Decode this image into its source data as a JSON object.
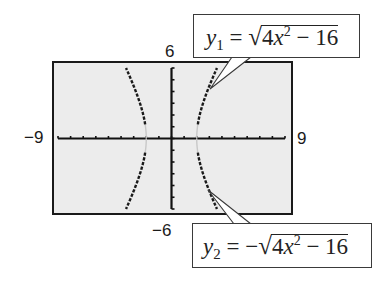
{
  "chart_data": {
    "type": "line",
    "title": "",
    "window": {
      "xmin": -9,
      "xmax": 9,
      "ymin": -6,
      "ymax": 6
    },
    "xlabel": "",
    "ylabel": "",
    "tick_labels": {
      "xmin": "−9",
      "xmax": "9",
      "ymin": "−6",
      "ymax": "6"
    },
    "x_tick_step": 1,
    "y_tick_step": 1,
    "grid": false,
    "series": [
      {
        "name": "y1",
        "equation": "y1 = sqrt(4x^2 - 16)",
        "branch": "upper",
        "domain": "|x| >= 2",
        "points": [
          [
            -3.6,
            6.0
          ],
          [
            -3.4,
            5.36
          ],
          [
            -3.2,
            4.8
          ],
          [
            -3.0,
            4.47
          ],
          [
            -2.8,
            4.0
          ],
          [
            -2.6,
            3.32
          ],
          [
            -2.4,
            2.65
          ],
          [
            -2.2,
            1.83
          ],
          [
            -2.0,
            0
          ],
          [
            2.0,
            0
          ],
          [
            2.2,
            1.83
          ],
          [
            2.4,
            2.65
          ],
          [
            2.6,
            3.32
          ],
          [
            2.8,
            4.0
          ],
          [
            3.0,
            4.47
          ],
          [
            3.2,
            4.8
          ],
          [
            3.4,
            5.36
          ],
          [
            3.6,
            6.0
          ]
        ]
      },
      {
        "name": "y2",
        "equation": "y2 = -sqrt(4x^2 - 16)",
        "branch": "lower",
        "domain": "|x| >= 2",
        "points": [
          [
            -3.6,
            -6.0
          ],
          [
            -3.4,
            -5.36
          ],
          [
            -3.2,
            -4.8
          ],
          [
            -3.0,
            -4.47
          ],
          [
            -2.8,
            -4.0
          ],
          [
            -2.6,
            -3.32
          ],
          [
            -2.4,
            -2.65
          ],
          [
            -2.2,
            -1.83
          ],
          [
            -2.0,
            0
          ],
          [
            2.0,
            0
          ],
          [
            2.2,
            -1.83
          ],
          [
            2.4,
            -2.65
          ],
          [
            2.6,
            -3.32
          ],
          [
            2.8,
            -4.0
          ],
          [
            3.0,
            -4.47
          ],
          [
            3.2,
            -4.8
          ],
          [
            3.4,
            -5.36
          ],
          [
            3.6,
            -6.0
          ]
        ]
      }
    ]
  },
  "labels": {
    "ymax": "6",
    "ymin": "−6",
    "xmin": "−9",
    "xmax": "9"
  },
  "callouts": {
    "top": {
      "var": "y",
      "sub": "1",
      "equals": " = ",
      "neg": "",
      "radicand_a": "4",
      "radicand_x": "x",
      "radicand_exp": "2",
      "radicand_rest": " − 16"
    },
    "bottom": {
      "var": "y",
      "sub": "2",
      "equals": " = ",
      "neg": "−",
      "radicand_a": "4",
      "radicand_x": "x",
      "radicand_exp": "2",
      "radicand_rest": " − 16"
    }
  },
  "colors": {
    "screen_bg": "#ececec",
    "frame": "#1a1a1a",
    "axis": "#111111",
    "curve": "#1a1a1a",
    "curve_faint": "#c8c8c8"
  }
}
